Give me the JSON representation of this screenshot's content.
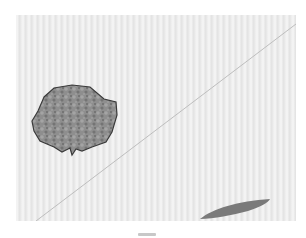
{
  "scene": {
    "description": "Floating textured rock above its cast shadow with a diagonal line across a striped backdrop",
    "colors": {
      "backdrop": "#ececec",
      "stripe_dark": "#e2e2e2",
      "rock_fill": "#8e8e8e",
      "rock_outline": "#3a3a3a",
      "shadow": "#7a7a7a",
      "line": "#bdbdbd"
    },
    "elements": {
      "rock": {
        "label": "rock"
      },
      "shadow": {
        "label": "shadow"
      },
      "line": {
        "label": "diagonal-line"
      }
    }
  }
}
